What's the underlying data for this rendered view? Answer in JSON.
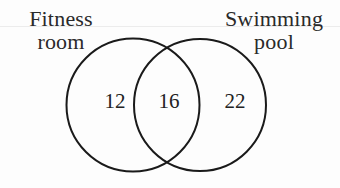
{
  "diagram": {
    "type": "venn",
    "sets": [
      {
        "id": "fitness_room",
        "label_lines": [
          "Fitness",
          "room"
        ],
        "only_count": "12"
      },
      {
        "id": "swimming_pool",
        "label_lines": [
          "Swimming",
          "pool"
        ],
        "only_count": "22"
      }
    ],
    "intersection": {
      "sets": [
        "fitness_room",
        "swimming_pool"
      ],
      "count": "16"
    },
    "colors": {
      "stroke": "#1a1a1a",
      "text": "#222222",
      "background": "#ffffff"
    }
  }
}
